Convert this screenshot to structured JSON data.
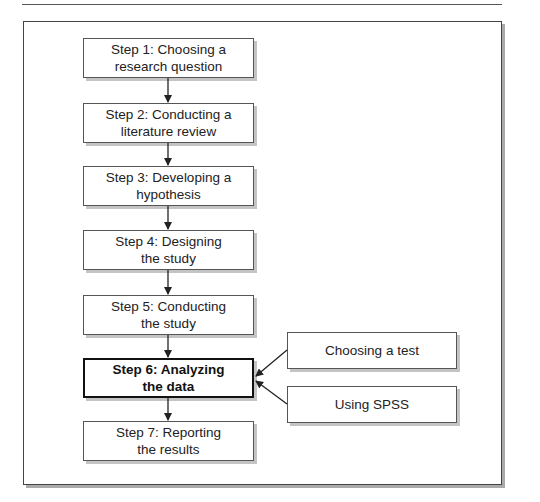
{
  "diagram": {
    "type": "flowchart",
    "steps": [
      {
        "line1": "Step 1: Choosing a",
        "line2": "research question"
      },
      {
        "line1": "Step 2: Conducting a",
        "line2": "literature review"
      },
      {
        "line1": "Step 3: Developing a",
        "line2": "hypothesis"
      },
      {
        "line1": "Step 4: Designing",
        "line2": "the study"
      },
      {
        "line1": "Step 5: Conducting",
        "line2": "the study"
      },
      {
        "line1": "Step 6: Analyzing",
        "line2": "the data",
        "highlighted": true
      },
      {
        "line1": "Step 7: Reporting",
        "line2": "the results"
      }
    ],
    "side_inputs": [
      {
        "label": "Choosing a test",
        "target_step": 6
      },
      {
        "label": "Using SPSS",
        "target_step": 6
      }
    ]
  }
}
